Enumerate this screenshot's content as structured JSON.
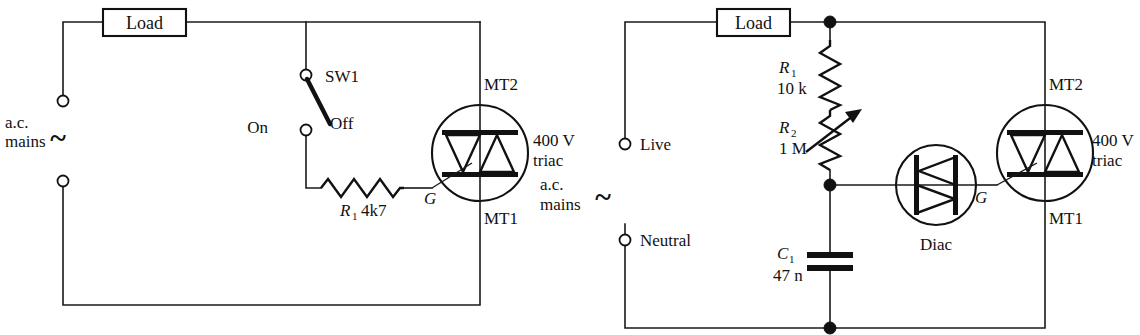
{
  "figure": {
    "type": "schematic-diagram",
    "line_color": "#111111",
    "background": "#ffffff"
  },
  "circuit_left": {
    "name": "triac-switch-circuit",
    "source": {
      "label_line1": "a.c.",
      "label_line2": "mains",
      "symbol": "~"
    },
    "load": {
      "label": "Load"
    },
    "switch": {
      "designator": "SW1",
      "position_left_label": "On",
      "position_right_label": "Off"
    },
    "resistor": {
      "designator": "R",
      "subscript": "1",
      "value": "4k7"
    },
    "triac": {
      "rating": "400 V",
      "type_label": "triac",
      "terminal_top": "MT2",
      "terminal_bottom": "MT1",
      "gate": "G"
    }
  },
  "circuit_right": {
    "name": "diac-triac-dimmer-circuit",
    "source": {
      "label_line1": "a.c.",
      "label_line2": "mains",
      "symbol": "~",
      "terminal_live": "Live",
      "terminal_neutral": "Neutral"
    },
    "load": {
      "label": "Load"
    },
    "resistor_fixed": {
      "designator": "R",
      "subscript": "1",
      "value": "10 k"
    },
    "resistor_variable": {
      "designator": "R",
      "subscript": "2",
      "value": "1 M"
    },
    "capacitor": {
      "designator": "C",
      "subscript": "1",
      "value": "47 n"
    },
    "diac": {
      "label": "Diac"
    },
    "triac": {
      "rating": "400 V",
      "type_label": "triac",
      "terminal_top": "MT2",
      "terminal_bottom": "MT1",
      "gate": "G"
    }
  }
}
